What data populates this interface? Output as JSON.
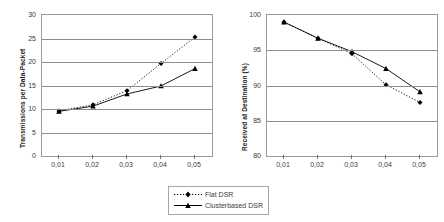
{
  "legend": {
    "position": "below-center",
    "entries": [
      {
        "label": "Flat DSR",
        "style": "dotted",
        "marker": "diamond",
        "color": "#000000"
      },
      {
        "label": "Clusterbased DSR",
        "style": "solid",
        "marker": "triangle",
        "color": "#000000"
      }
    ]
  },
  "chart_data": [
    {
      "type": "line",
      "title": "",
      "xlabel": "",
      "ylabel": "Transmissions per Data-Packet",
      "x": [
        0.01,
        0.02,
        0.03,
        0.04,
        0.05
      ],
      "categories": [
        "0,01",
        "0,02",
        "0,03",
        "0,04",
        "0,05"
      ],
      "xtick_labels": [
        "0,01",
        "0,02",
        "0,03",
        "0,04",
        "0,05"
      ],
      "ytick_labels": [
        "0",
        "5",
        "10",
        "15",
        "20",
        "25",
        "30"
      ],
      "yticks": [
        0,
        5,
        10,
        15,
        20,
        25,
        30
      ],
      "ylim": [
        0,
        30
      ],
      "xlim": [
        0.005,
        0.055
      ],
      "grid": "horizontal",
      "series": [
        {
          "name": "Flat DSR",
          "values": [
            9.6,
            10.9,
            13.9,
            19.7,
            25.3
          ],
          "style": "dotted",
          "marker": "diamond"
        },
        {
          "name": "Clusterbased DSR",
          "values": [
            9.5,
            10.6,
            13.2,
            14.9,
            18.6
          ],
          "style": "solid",
          "marker": "triangle"
        }
      ]
    },
    {
      "type": "line",
      "title": "",
      "xlabel": "",
      "ylabel": "Received at Destination (%)",
      "x": [
        0.01,
        0.02,
        0.03,
        0.04,
        0.05
      ],
      "categories": [
        "0,01",
        "0,02",
        "0,03",
        "0,04",
        "0,05"
      ],
      "xtick_labels": [
        "0,01",
        "0,02",
        "0,03",
        "0,04",
        "0,05"
      ],
      "ytick_labels": [
        "80",
        "85",
        "90",
        "95",
        "100"
      ],
      "yticks": [
        80,
        85,
        90,
        95,
        100
      ],
      "ylim": [
        80,
        100
      ],
      "xlim": [
        0.005,
        0.055
      ],
      "grid": "horizontal",
      "series": [
        {
          "name": "Flat DSR",
          "values": [
            99.0,
            96.7,
            94.5,
            90.1,
            87.6
          ],
          "style": "dotted",
          "marker": "diamond"
        },
        {
          "name": "Clusterbased DSR",
          "values": [
            99.0,
            96.7,
            94.8,
            92.4,
            89.1
          ],
          "style": "solid",
          "marker": "triangle"
        }
      ]
    }
  ]
}
